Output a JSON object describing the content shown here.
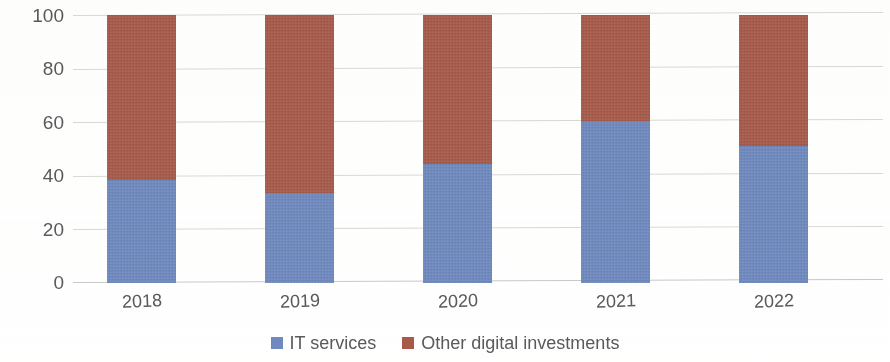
{
  "chart_data": {
    "type": "bar",
    "subtype": "stacked-bar-100-percent",
    "title": "",
    "subtitle": "",
    "xlabel": "",
    "ylabel": "",
    "categories": [
      "2018",
      "2019",
      "2020",
      "2021",
      "2022"
    ],
    "series": [
      {
        "name": "IT services",
        "color": "#6f8ac0",
        "values": [
          38.5,
          33.5,
          44.5,
          60.5,
          51.0
        ]
      },
      {
        "name": "Other digital investments",
        "color": "#a85a49",
        "values": [
          61.5,
          66.5,
          55.5,
          39.5,
          49.0
        ]
      }
    ],
    "ylim": [
      0,
      100
    ],
    "yticks": [
      0,
      20,
      40,
      60,
      80,
      100
    ],
    "ytick_labels": [
      "0",
      "20",
      "40",
      "60",
      "80",
      "100"
    ],
    "grid": true,
    "grid_axis": "y",
    "legend": true,
    "legend_position": "bottom",
    "legend_entries": [
      {
        "label": "IT services",
        "color": "#6f8ac0",
        "swatch": "legend-swatch-it-services"
      },
      {
        "label": "Other digital investments",
        "color": "#a85a49",
        "swatch": "legend-swatch-other-digital-investments"
      }
    ]
  },
  "axes": {
    "y": {
      "ticks": [
        {
          "label": "100",
          "value": 100
        },
        {
          "label": "80",
          "value": 80
        },
        {
          "label": "60",
          "value": 60
        },
        {
          "label": "40",
          "value": 40
        },
        {
          "label": "20",
          "value": 20
        },
        {
          "label": "0",
          "value": 0
        }
      ]
    },
    "x": {
      "ticks": [
        {
          "label": "2018"
        },
        {
          "label": "2019"
        },
        {
          "label": "2020"
        },
        {
          "label": "2021"
        },
        {
          "label": "2022"
        }
      ]
    }
  },
  "colors": {
    "series_it_services": "#6f8ac0",
    "series_other_digital": "#a85a49",
    "gridline": "#d9d9d9",
    "text": "#5a5a5a",
    "background": "#ffffff"
  }
}
